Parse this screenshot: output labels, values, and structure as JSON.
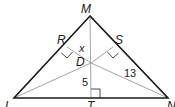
{
  "diagram": {
    "type": "triangle-geometry",
    "vertices": {
      "M": {
        "label": "M",
        "x": 90,
        "y": 16
      },
      "L": {
        "label": "L",
        "x": 14,
        "y": 98
      },
      "N": {
        "label": "N",
        "x": 168,
        "y": 98
      }
    },
    "points": {
      "D": {
        "label": "D",
        "x": 91,
        "y": 63
      },
      "R": {
        "label": "R",
        "x": 67,
        "y": 47
      },
      "S": {
        "label": "S",
        "x": 113,
        "y": 47
      },
      "T": {
        "label": "T",
        "x": 91,
        "y": 98
      }
    },
    "segment_labels": {
      "DR": "x",
      "DT": "5",
      "DN": "13"
    },
    "right_angles": [
      "R",
      "S",
      "T"
    ],
    "colors": {
      "outline": "#1a1a1a",
      "inner": "#9a9a9a"
    }
  }
}
